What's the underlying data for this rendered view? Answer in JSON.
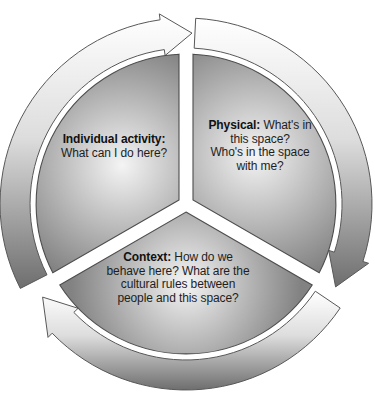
{
  "figure": {
    "type": "cycle-diagram",
    "segment_count": 3,
    "arrow_direction": "clockwise"
  },
  "segments": {
    "individual": {
      "bold": "Individual activity:",
      "after_bold": "",
      "rest_lines": [
        "What can I do here?"
      ]
    },
    "physical": {
      "bold": "Physical:",
      "after_bold": " What's in",
      "rest_lines": [
        "this space?",
        "Who's in the space",
        "with me?"
      ]
    },
    "context": {
      "bold": "Context:",
      "after_bold": " How do we",
      "rest_lines": [
        "behave here? What are the",
        "cultural rules between",
        "people and this space?"
      ]
    }
  },
  "arrows": [
    {
      "name": "top-arc-arrow",
      "points": "right"
    },
    {
      "name": "right-arc-arrow",
      "points": "down-left"
    },
    {
      "name": "bottom-arc-arrow",
      "points": "up-left"
    }
  ],
  "colors": {
    "background": "#ffffff",
    "wedge_light": "#f4f4f4",
    "wedge_dark": "#828282",
    "band_light": "#ffffff",
    "band_mid": "#dddddd",
    "band_dark": "#6e6e6e",
    "outline": "#4d4d4d",
    "band_outline": "#585858",
    "text": "#1e1e1e"
  }
}
